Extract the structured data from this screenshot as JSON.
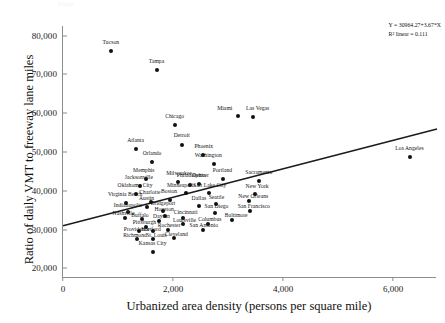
{
  "caption": "Figure",
  "annotation": {
    "equation": "Y = 30964.27+3.67*X",
    "r_squared": "R² linear = 0.111"
  },
  "chart_data": {
    "type": "scatter",
    "title": "",
    "xlabel": "Urbanized area density (persons per square mile)",
    "ylabel": "Ratio of daily VMT to freeway lane miles",
    "xlim": [
      0,
      6800
    ],
    "ylim": [
      17500,
      82500
    ],
    "xticks": [
      0,
      2000,
      4000,
      6000
    ],
    "xticklabels": [
      "0",
      "2,000",
      "4,000",
      "6,000"
    ],
    "yticks": [
      20000,
      30000,
      40000,
      50000,
      60000,
      70000,
      80000
    ],
    "yticklabels": [
      "20,000",
      "30,000",
      "40,000",
      "50,000",
      "60,000",
      "70,000",
      "80,000"
    ],
    "grid": false,
    "legend": null,
    "marker_color": "#111111",
    "line_color": "#1a1a1a",
    "axis_color": "#8c8c8c",
    "fit": {
      "intercept": 30964.27,
      "slope": 3.67,
      "r2": 0.111,
      "x_start": 0,
      "x_end": 6800
    },
    "points": [
      {
        "label": "Tucson",
        "x": 870,
        "y": 76000,
        "lx": 870,
        "ly": 78100,
        "align": "c"
      },
      {
        "label": "Tampa",
        "x": 1700,
        "y": 71200,
        "lx": 1700,
        "ly": 73300,
        "align": "c"
      },
      {
        "label": "Miami",
        "x": 3180,
        "y": 59300,
        "lx": 3080,
        "ly": 61200,
        "align": "r"
      },
      {
        "label": "Las Vegas",
        "x": 3450,
        "y": 58900,
        "lx": 3540,
        "ly": 61200,
        "align": "c"
      },
      {
        "label": "Chicago",
        "x": 2030,
        "y": 57000,
        "lx": 2030,
        "ly": 59100,
        "align": "c"
      },
      {
        "label": "Detroit",
        "x": 2160,
        "y": 51800,
        "lx": 2160,
        "ly": 54000,
        "align": "c"
      },
      {
        "label": "Atlanta",
        "x": 1320,
        "y": 50700,
        "lx": 1320,
        "ly": 52800,
        "align": "c"
      },
      {
        "label": "Phoenix",
        "x": 2540,
        "y": 49100,
        "lx": 2560,
        "ly": 51200,
        "align": "c"
      },
      {
        "label": "Los Angeles",
        "x": 6300,
        "y": 48800,
        "lx": 6300,
        "ly": 50900,
        "align": "c"
      },
      {
        "label": "Orlando",
        "x": 1620,
        "y": 47500,
        "lx": 1620,
        "ly": 49600,
        "align": "c"
      },
      {
        "label": "Washington",
        "x": 2750,
        "y": 46800,
        "lx": 2640,
        "ly": 48900,
        "align": "c"
      },
      {
        "label": "Portland",
        "x": 2900,
        "y": 43100,
        "lx": 2900,
        "ly": 45200,
        "align": "c"
      },
      {
        "label": "Sacramento",
        "x": 3560,
        "y": 42500,
        "lx": 3560,
        "ly": 44600,
        "align": "c"
      },
      {
        "label": "Memphis",
        "x": 1500,
        "y": 43000,
        "lx": 1470,
        "ly": 45100,
        "align": "c"
      },
      {
        "label": "Milwaukee",
        "x": 2090,
        "y": 42200,
        "lx": 2110,
        "ly": 44300,
        "align": "c"
      },
      {
        "label": "Philadelphia",
        "x": 2310,
        "y": 41600,
        "lx": 2330,
        "ly": 43700,
        "align": "c"
      },
      {
        "label": "Jacksonville",
        "x": 1400,
        "y": 41200,
        "lx": 1380,
        "ly": 43300,
        "align": "c"
      },
      {
        "label": "New York",
        "x": 3490,
        "y": 39200,
        "lx": 3530,
        "ly": 41000,
        "align": "c"
      },
      {
        "label": "Salt Lake City",
        "x": 2650,
        "y": 39400,
        "lx": 2670,
        "ly": 41300,
        "align": "c"
      },
      {
        "label": "Minneapolis",
        "x": 2230,
        "y": 39300,
        "lx": 2150,
        "ly": 41300,
        "align": "c"
      },
      {
        "label": "Oklahoma City",
        "x": 1330,
        "y": 39100,
        "lx": 1310,
        "ly": 41200,
        "align": "c"
      },
      {
        "label": "Denver",
        "x": 2480,
        "y": 41700,
        "lx": 2500,
        "ly": 43700,
        "align": "c"
      },
      {
        "label": "Charlotte",
        "x": 1600,
        "y": 37200,
        "lx": 1580,
        "ly": 39300,
        "align": "c"
      },
      {
        "label": "Virginia Beach",
        "x": 1150,
        "y": 36900,
        "lx": 1130,
        "ly": 38900,
        "align": "c"
      },
      {
        "label": "Boston",
        "x": 1950,
        "y": 37600,
        "lx": 1930,
        "ly": 39600,
        "align": "c"
      },
      {
        "label": "New Orleans",
        "x": 3390,
        "y": 37400,
        "lx": 3460,
        "ly": 38300,
        "align": "c"
      },
      {
        "label": "Dallas",
        "x": 2480,
        "y": 36100,
        "lx": 2470,
        "ly": 38000,
        "align": "c"
      },
      {
        "label": "Seattle",
        "x": 2780,
        "y": 36600,
        "lx": 2790,
        "ly": 38200,
        "align": "c"
      },
      {
        "label": "Austin",
        "x": 1530,
        "y": 35800,
        "lx": 1520,
        "ly": 37800,
        "align": "c"
      },
      {
        "label": "San Francisco",
        "x": 3400,
        "y": 34800,
        "lx": 3470,
        "ly": 35700,
        "align": "c"
      },
      {
        "label": "San Diego",
        "x": 2760,
        "y": 34200,
        "lx": 2790,
        "ly": 35700,
        "align": "c"
      },
      {
        "label": "Bridgeport",
        "x": 1820,
        "y": 34900,
        "lx": 1820,
        "ly": 36500,
        "align": "c"
      },
      {
        "label": "Indianapolis",
        "x": 1190,
        "y": 34500,
        "lx": 1180,
        "ly": 36000,
        "align": "c"
      },
      {
        "label": "Houston",
        "x": 1860,
        "y": 33500,
        "lx": 1840,
        "ly": 35000,
        "align": "c"
      },
      {
        "label": "Baltimore",
        "x": 3080,
        "y": 32500,
        "lx": 3150,
        "ly": 33400,
        "align": "c"
      },
      {
        "label": "Cincinnati",
        "x": 2180,
        "y": 33100,
        "lx": 2230,
        "ly": 34300,
        "align": "c"
      },
      {
        "label": "Nashville",
        "x": 1120,
        "y": 33000,
        "lx": 1100,
        "ly": 33900,
        "align": "c"
      },
      {
        "label": "Buffalo",
        "x": 1430,
        "y": 32700,
        "lx": 1400,
        "ly": 33600,
        "align": "c"
      },
      {
        "label": "Columbus",
        "x": 2630,
        "y": 31500,
        "lx": 2670,
        "ly": 32500,
        "align": "c"
      },
      {
        "label": "Dayton",
        "x": 1750,
        "y": 32300,
        "lx": 1790,
        "ly": 33200,
        "align": "c"
      },
      {
        "label": "Louisville",
        "x": 2190,
        "y": 31300,
        "lx": 2210,
        "ly": 32200,
        "align": "c"
      },
      {
        "label": "Pittsburgh",
        "x": 1510,
        "y": 30600,
        "lx": 1480,
        "ly": 31600,
        "align": "c"
      },
      {
        "label": "San Antonio",
        "x": 2540,
        "y": 29800,
        "lx": 2560,
        "ly": 30800,
        "align": "c"
      },
      {
        "label": "Rochester",
        "x": 1900,
        "y": 29900,
        "lx": 1930,
        "ly": 30900,
        "align": "c"
      },
      {
        "label": "Hartford",
        "x": 1640,
        "y": 29700,
        "lx": 1600,
        "ly": 29900,
        "align": "c"
      },
      {
        "label": "Providence",
        "x": 1390,
        "y": 29500,
        "lx": 1340,
        "ly": 29900,
        "align": "c"
      },
      {
        "label": "Cleveland",
        "x": 2010,
        "y": 27900,
        "lx": 2060,
        "ly": 28700,
        "align": "c"
      },
      {
        "label": "St. Louis",
        "x": 1630,
        "y": 27600,
        "lx": 1700,
        "ly": 28400,
        "align": "c"
      },
      {
        "label": "Richmond",
        "x": 1350,
        "y": 27500,
        "lx": 1310,
        "ly": 28300,
        "align": "c"
      },
      {
        "label": "Kansas City",
        "x": 1630,
        "y": 24200,
        "lx": 1630,
        "ly": 26300,
        "align": "c"
      }
    ]
  }
}
